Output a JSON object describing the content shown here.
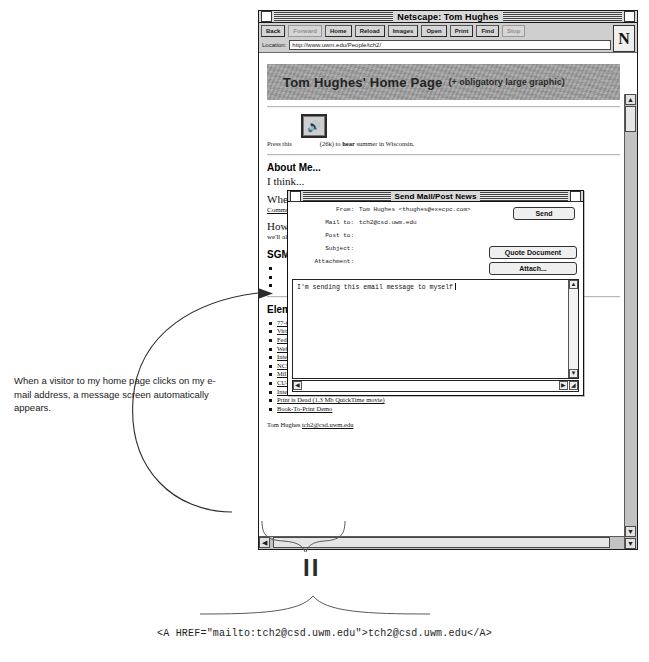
{
  "browser": {
    "title": "Netscape: Tom Hughes",
    "toolbar_buttons": [
      {
        "label": "Back",
        "disabled": false
      },
      {
        "label": "Forward",
        "disabled": true
      },
      {
        "label": "Home",
        "disabled": false
      },
      {
        "label": "Reload",
        "disabled": false
      },
      {
        "label": "Images",
        "disabled": false
      },
      {
        "label": "Open",
        "disabled": false
      },
      {
        "label": "Print",
        "disabled": false
      },
      {
        "label": "Find",
        "disabled": false
      },
      {
        "label": "Stop",
        "disabled": true
      }
    ],
    "location_label": "Location:",
    "location_value": "http://www.uwm.edu/People/tch2/",
    "logo_letter": "N"
  },
  "page": {
    "banner_title": "Tom Hughes' Home Page",
    "banner_subtitle": "(+ obligatory large graphic)",
    "sound_prefix": "Press this",
    "sound_suffix_size": "(26k)",
    "sound_suffix_a": "to",
    "sound_suffix_bold": "hear",
    "sound_suffix_b": "summer in Wisconsin.",
    "speaker_icon": "speaker-icon",
    "heading_about": "About Me...",
    "para1": "I think...",
    "para2": "When...",
    "para2_link": "Commu...",
    "para3": "Howe...",
    "para3_cont": "we'll al...",
    "right_frag_1": "inted",
    "right_frag_2": "er,",
    "heading_sgm": "SGM",
    "heading_elements": "Elem",
    "links": [
      "77-O79 Home Page",
      "Virtual Reference Desk",
      "FedWorld",
      "Webco",
      "Internet School Networking",
      "NCSA Educational Programs",
      "Millerville School, UT",
      "CU-SeeMe",
      "Internet statistics",
      "Print is Dead (1.3 Mb QuickTime movie)",
      "Book-To-Print Demo"
    ],
    "links_tail": {
      "internet_school_networking": ", an Internet Engineering Task Force (IETF) working group",
      "cu_seeme": " video-conferencing shareware",
      "internet_statistics": " from Georgia Tech"
    },
    "signature_name": "Tom Hughes",
    "signature_email": "tch2@csd.uwm.edu"
  },
  "mail_dialog": {
    "title": "Send Mail/Post News",
    "fields": [
      {
        "label": "From:",
        "value": "Tom Hughes <thughes@execpc.com>"
      },
      {
        "label": "Mail to:",
        "value": "tch2@csd.uwm.edu"
      },
      {
        "label": "Post to:",
        "value": ""
      },
      {
        "label": "Subject:",
        "value": ""
      },
      {
        "label": "Attachment:",
        "value": ""
      }
    ],
    "send_label": "Send",
    "quote_label": "Quote Document",
    "attach_label": "Attach...",
    "body_text": "I'm sending this email message to myself"
  },
  "annotation": {
    "text": "When a visitor to my home page clicks on my e-mail address, a message screen automatically appears."
  },
  "equals": {
    "symbol": "II"
  },
  "code_caption": {
    "text": "<A HREF=\"mailto:tch2@csd.uwm.edu\">tch2@csd.uwm.edu</A>"
  }
}
